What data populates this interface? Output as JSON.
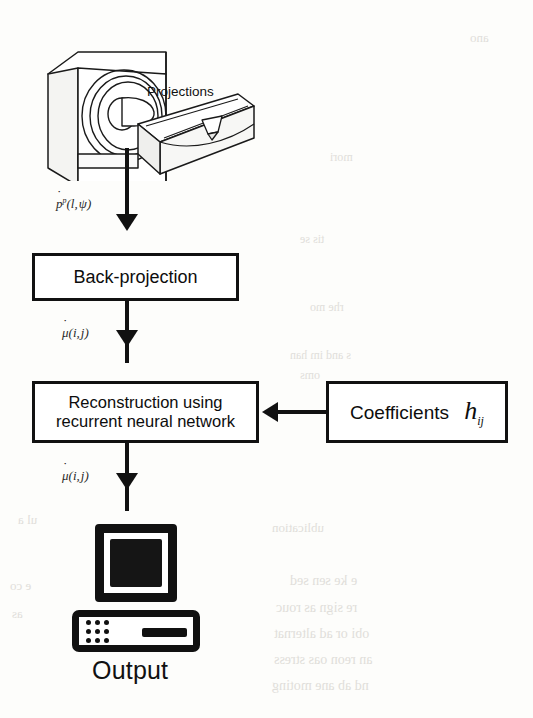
{
  "figure": {
    "type": "flowchart",
    "orientation": "top-to-bottom"
  },
  "scanner": {
    "icon_name": "ct-scanner-gantry-with-patient-table",
    "projections_label": "Projections"
  },
  "nodes": [
    {
      "id": "backprojection",
      "label": "Back-projection",
      "shape": "rectangle"
    },
    {
      "id": "reconstruction",
      "label_line1": "Reconstruction using",
      "label_line2": "recurrent neural network",
      "shape": "rectangle"
    },
    {
      "id": "coefficients",
      "label": "Coefficients",
      "symbol": "h",
      "symbol_sub": "ij",
      "shape": "rectangle"
    },
    {
      "id": "output",
      "label": "Output",
      "icon_name": "desktop-computer-icon"
    }
  ],
  "edge_labels": {
    "projections_to_backprojection": {
      "base": "p",
      "sup": "p",
      "args": "(l, ψ)",
      "accent": "dot"
    },
    "backprojection_to_reconstruction": {
      "base": "μ",
      "args": "(i, j)",
      "accent": "dot"
    },
    "reconstruction_to_output": {
      "base": "μ",
      "args": "(i, j)",
      "accent": "dot"
    }
  },
  "colors": {
    "ink": "#111111",
    "paper": "#fdfdfb",
    "screen": "#151515",
    "bleed_text": "#c9c6c0"
  },
  "bleed_through": [
    {
      "text": "ano",
      "x": 470,
      "y": 30,
      "size": 13
    },
    {
      "text": "mori",
      "x": 330,
      "y": 150,
      "size": 12
    },
    {
      "text": "tis se",
      "x": 300,
      "y": 232,
      "size": 12
    },
    {
      "text": "rhe mo",
      "x": 310,
      "y": 300,
      "size": 12
    },
    {
      "text": "s and im han",
      "x": 290,
      "y": 348,
      "size": 12
    },
    {
      "text": "oms",
      "x": 300,
      "y": 368,
      "size": 12
    },
    {
      "text": "ublication",
      "x": 272,
      "y": 520,
      "size": 13
    },
    {
      "text": "e ke sen sed",
      "x": 290,
      "y": 573,
      "size": 14
    },
    {
      "text": "re sign as rouc",
      "x": 276,
      "y": 600,
      "size": 14
    },
    {
      "text": "obi or ad alternat",
      "x": 274,
      "y": 626,
      "size": 14
    },
    {
      "text": "an reon oas stress",
      "x": 274,
      "y": 652,
      "size": 14
    },
    {
      "text": "nd ab ane moting",
      "x": 272,
      "y": 678,
      "size": 14
    },
    {
      "text": "ul a",
      "x": 18,
      "y": 512,
      "size": 13
    },
    {
      "text": "e co",
      "x": 10,
      "y": 578,
      "size": 13
    },
    {
      "text": "as",
      "x": 12,
      "y": 606,
      "size": 13
    }
  ]
}
